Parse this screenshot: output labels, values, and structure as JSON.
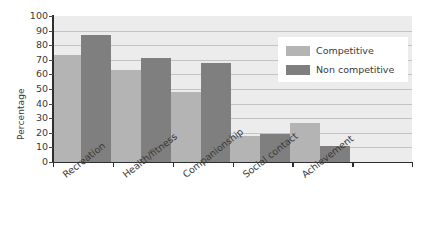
{
  "chart_data": {
    "type": "bar",
    "title": "",
    "xlabel": "",
    "ylabel": "Percentage",
    "ylim": [
      0,
      100
    ],
    "ytick_step": 10,
    "yticks": [
      100,
      90,
      80,
      70,
      60,
      50,
      40,
      30,
      20,
      10,
      0
    ],
    "grid": true,
    "grid_axis": "y",
    "legend_position": "top-right",
    "categories": [
      "Recreation",
      "Health/fitness",
      "Companionship",
      "Social contact",
      "Achievement"
    ],
    "series": [
      {
        "name": "Competitive",
        "color": "#b4b4b4",
        "values": [
          73,
          63,
          48,
          18,
          27
        ]
      },
      {
        "name": "Non competitive",
        "color": "#7f7f7f",
        "values": [
          87,
          71,
          68,
          19,
          11
        ]
      }
    ]
  },
  "legend": {
    "items": [
      {
        "label": "Competitive"
      },
      {
        "label": "Non competitive"
      }
    ]
  },
  "axis": {
    "y_title": "Percentage"
  },
  "colors": {
    "plot_background": "#ececec",
    "gridline": "#c3c3c3",
    "axis": "#2e2e2e",
    "competitive": "#b4b4b4",
    "non_competitive": "#7f7f7f",
    "text": "#3a3a3a",
    "legend_background": "#ffffff"
  }
}
